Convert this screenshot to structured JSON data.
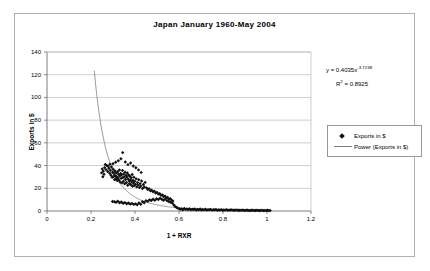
{
  "chart_data": {
    "type": "scatter",
    "title": "Japan  January 1960-May 2004",
    "xlabel": "1 + RXR",
    "ylabel": "Exports in $",
    "xlim": [
      0,
      1.2
    ],
    "ylim": [
      0,
      140
    ],
    "xticks": [
      "0",
      "0.2",
      "0.4",
      "0.6",
      "0.8",
      "1",
      "1.2"
    ],
    "xtick_values": [
      0,
      0.2,
      0.4,
      0.6,
      0.8,
      1.0,
      1.2
    ],
    "yticks": [
      "0",
      "20",
      "40",
      "60",
      "80",
      "100",
      "120",
      "140"
    ],
    "ytick_values": [
      0,
      20,
      40,
      60,
      80,
      100,
      120,
      140
    ],
    "grid": "horizontal",
    "legend_position": "right",
    "legend": [
      {
        "label": "Exports in $",
        "marker": "diamond",
        "color": "#101010"
      },
      {
        "label": "Power (Exports in $)",
        "marker": "line",
        "color": "#808080"
      }
    ],
    "annotations": {
      "equation_prefix": "y = 0.4035x",
      "equation_exponent": "-3.7238",
      "r_squared_prefix": "R",
      "r_squared_sup": "2",
      "r_squared_value": " = 0.8925"
    },
    "trendline": {
      "type": "power",
      "coefficient": 0.4035,
      "exponent": -3.7238,
      "r_squared": 0.8925,
      "color": "#808080",
      "x_start": 0.215,
      "x_end": 1.02
    },
    "series": [
      {
        "name": "Exports in $",
        "marker": "diamond",
        "color": "#101010",
        "points": [
          [
            0.262,
            38.2
          ],
          [
            0.268,
            36.4
          ],
          [
            0.272,
            40.1
          ],
          [
            0.276,
            34.8
          ],
          [
            0.281,
            37.6
          ],
          [
            0.285,
            33.2
          ],
          [
            0.288,
            35.9
          ],
          [
            0.291,
            31.5
          ],
          [
            0.293,
            38.8
          ],
          [
            0.296,
            29.7
          ],
          [
            0.298,
            34.1
          ],
          [
            0.301,
            36.8
          ],
          [
            0.303,
            30.4
          ],
          [
            0.305,
            32.9
          ],
          [
            0.307,
            27.6
          ],
          [
            0.309,
            35.3
          ],
          [
            0.311,
            31.1
          ],
          [
            0.313,
            28.4
          ],
          [
            0.315,
            33.7
          ],
          [
            0.317,
            30.2
          ],
          [
            0.319,
            26.9
          ],
          [
            0.321,
            34.5
          ],
          [
            0.323,
            29.1
          ],
          [
            0.325,
            32.3
          ],
          [
            0.327,
            27.1
          ],
          [
            0.329,
            36.1
          ],
          [
            0.331,
            30.8
          ],
          [
            0.333,
            25.4
          ],
          [
            0.335,
            33.0
          ],
          [
            0.337,
            28.7
          ],
          [
            0.339,
            31.9
          ],
          [
            0.341,
            24.8
          ],
          [
            0.343,
            35.6
          ],
          [
            0.345,
            29.5
          ],
          [
            0.347,
            26.2
          ],
          [
            0.349,
            32.6
          ],
          [
            0.351,
            30.0
          ],
          [
            0.353,
            23.9
          ],
          [
            0.355,
            34.2
          ],
          [
            0.357,
            27.8
          ],
          [
            0.359,
            31.3
          ],
          [
            0.361,
            25.1
          ],
          [
            0.363,
            29.9
          ],
          [
            0.365,
            33.4
          ],
          [
            0.367,
            22.7
          ],
          [
            0.369,
            28.1
          ],
          [
            0.371,
            31.7
          ],
          [
            0.373,
            26.5
          ],
          [
            0.375,
            24.2
          ],
          [
            0.377,
            30.6
          ],
          [
            0.379,
            27.3
          ],
          [
            0.381,
            23.1
          ],
          [
            0.383,
            29.2
          ],
          [
            0.385,
            25.8
          ],
          [
            0.387,
            32.1
          ],
          [
            0.389,
            21.9
          ],
          [
            0.391,
            27.0
          ],
          [
            0.393,
            24.5
          ],
          [
            0.395,
            29.8
          ],
          [
            0.397,
            22.3
          ],
          [
            0.399,
            26.1
          ],
          [
            0.402,
            23.4
          ],
          [
            0.405,
            28.3
          ],
          [
            0.408,
            21.2
          ],
          [
            0.411,
            25.0
          ],
          [
            0.414,
            22.8
          ],
          [
            0.417,
            27.5
          ],
          [
            0.42,
            20.6
          ],
          [
            0.423,
            24.1
          ],
          [
            0.426,
            22.0
          ],
          [
            0.43,
            26.4
          ],
          [
            0.434,
            19.8
          ],
          [
            0.438,
            23.3
          ],
          [
            0.442,
            21.1
          ],
          [
            0.446,
            25.2
          ],
          [
            0.3,
            41.6
          ],
          [
            0.312,
            42.9
          ],
          [
            0.324,
            44.3
          ],
          [
            0.336,
            46.0
          ],
          [
            0.344,
            51.4
          ],
          [
            0.356,
            43.1
          ],
          [
            0.368,
            40.8
          ],
          [
            0.38,
            42.2
          ],
          [
            0.392,
            39.6
          ],
          [
            0.404,
            38.1
          ],
          [
            0.416,
            36.2
          ],
          [
            0.428,
            34.0
          ],
          [
            0.265,
            40.9
          ],
          [
            0.278,
            39.3
          ],
          [
            0.286,
            41.2
          ],
          [
            0.256,
            35.1
          ],
          [
            0.259,
            32.4
          ],
          [
            0.251,
            37.0
          ],
          [
            0.254,
            30.1
          ],
          [
            0.248,
            33.6
          ],
          [
            0.452,
            20.4
          ],
          [
            0.458,
            18.9
          ],
          [
            0.464,
            19.7
          ],
          [
            0.47,
            17.8
          ],
          [
            0.476,
            18.3
          ],
          [
            0.482,
            16.9
          ],
          [
            0.488,
            17.5
          ],
          [
            0.494,
            15.8
          ],
          [
            0.5,
            16.4
          ],
          [
            0.506,
            14.9
          ],
          [
            0.512,
            15.3
          ],
          [
            0.518,
            13.8
          ],
          [
            0.524,
            14.2
          ],
          [
            0.53,
            12.7
          ],
          [
            0.536,
            13.1
          ],
          [
            0.542,
            11.6
          ],
          [
            0.548,
            12.0
          ],
          [
            0.554,
            10.5
          ],
          [
            0.56,
            10.9
          ],
          [
            0.566,
            9.6
          ],
          [
            0.298,
            8.4
          ],
          [
            0.306,
            8.1
          ],
          [
            0.314,
            7.7
          ],
          [
            0.322,
            8.6
          ],
          [
            0.33,
            7.2
          ],
          [
            0.338,
            7.9
          ],
          [
            0.346,
            6.8
          ],
          [
            0.354,
            7.4
          ],
          [
            0.362,
            6.4
          ],
          [
            0.37,
            7.0
          ],
          [
            0.378,
            6.1
          ],
          [
            0.386,
            6.7
          ],
          [
            0.394,
            5.8
          ],
          [
            0.402,
            6.3
          ],
          [
            0.41,
            5.5
          ],
          [
            0.418,
            7.1
          ],
          [
            0.426,
            6.0
          ],
          [
            0.434,
            8.2
          ],
          [
            0.442,
            7.3
          ],
          [
            0.45,
            9.1
          ],
          [
            0.458,
            8.5
          ],
          [
            0.466,
            9.8
          ],
          [
            0.474,
            9.2
          ],
          [
            0.482,
            10.4
          ],
          [
            0.49,
            9.5
          ],
          [
            0.498,
            10.8
          ],
          [
            0.506,
            10.1
          ],
          [
            0.514,
            11.2
          ],
          [
            0.522,
            10.3
          ],
          [
            0.53,
            9.4
          ],
          [
            0.538,
            10.6
          ],
          [
            0.546,
            9.0
          ],
          [
            0.554,
            8.3
          ],
          [
            0.562,
            7.6
          ],
          [
            0.57,
            6.9
          ],
          [
            0.6,
            2.1
          ],
          [
            0.612,
            1.9
          ],
          [
            0.624,
            2.3
          ],
          [
            0.636,
            1.7
          ],
          [
            0.648,
            2.0
          ],
          [
            0.66,
            1.6
          ],
          [
            0.672,
            1.8
          ],
          [
            0.684,
            1.4
          ],
          [
            0.696,
            1.7
          ],
          [
            0.708,
            1.3
          ],
          [
            0.72,
            1.5
          ],
          [
            0.732,
            1.2
          ],
          [
            0.744,
            1.4
          ],
          [
            0.756,
            1.1
          ],
          [
            0.768,
            1.3
          ],
          [
            0.78,
            1.0
          ],
          [
            0.792,
            1.2
          ],
          [
            0.804,
            0.9
          ],
          [
            0.816,
            1.1
          ],
          [
            0.828,
            0.8
          ],
          [
            0.84,
            1.0
          ],
          [
            0.852,
            0.7
          ],
          [
            0.864,
            0.9
          ],
          [
            0.876,
            0.6
          ],
          [
            0.888,
            0.8
          ],
          [
            0.9,
            0.5
          ],
          [
            0.912,
            0.7
          ],
          [
            0.924,
            0.4
          ],
          [
            0.936,
            0.6
          ],
          [
            0.948,
            0.5
          ],
          [
            0.96,
            0.4
          ],
          [
            0.972,
            0.5
          ],
          [
            0.984,
            0.3
          ],
          [
            0.996,
            0.4
          ],
          [
            1.008,
            0.3
          ],
          [
            0.606,
            1.5
          ],
          [
            0.618,
            1.1
          ],
          [
            0.63,
            1.4
          ],
          [
            0.642,
            1.2
          ],
          [
            0.654,
            1.0
          ],
          [
            0.666,
            1.3
          ],
          [
            0.678,
            0.9
          ],
          [
            0.69,
            1.1
          ],
          [
            0.702,
            0.8
          ],
          [
            0.714,
            1.0
          ],
          [
            0.726,
            0.9
          ],
          [
            0.738,
            1.1
          ],
          [
            0.75,
            0.8
          ],
          [
            0.762,
            1.0
          ],
          [
            0.774,
            0.7
          ],
          [
            0.786,
            0.9
          ],
          [
            0.798,
            0.6
          ],
          [
            0.81,
            0.8
          ],
          [
            0.822,
            0.7
          ],
          [
            0.834,
            0.9
          ],
          [
            0.846,
            0.6
          ],
          [
            0.858,
            0.8
          ],
          [
            0.87,
            0.5
          ],
          [
            0.882,
            0.7
          ],
          [
            0.894,
            0.6
          ],
          [
            0.906,
            0.8
          ],
          [
            0.918,
            0.5
          ],
          [
            0.93,
            0.7
          ],
          [
            0.942,
            0.4
          ],
          [
            0.954,
            0.6
          ],
          [
            0.966,
            0.5
          ],
          [
            0.978,
            0.7
          ],
          [
            0.99,
            0.4
          ],
          [
            1.002,
            0.6
          ],
          [
            1.014,
            0.4
          ],
          [
            0.576,
            5.4
          ],
          [
            0.582,
            4.1
          ],
          [
            0.588,
            3.2
          ],
          [
            0.594,
            2.6
          ],
          [
            0.572,
            8.8
          ]
        ]
      }
    ]
  }
}
